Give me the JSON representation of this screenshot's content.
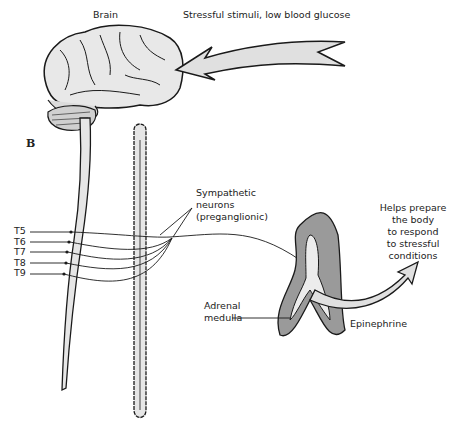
{
  "diagram": {
    "panel_letter": "B",
    "labels": {
      "brain": "Brain",
      "stimulus": "Stressful stimuli, low blood glucose",
      "sympathetic": [
        "Sympathetic",
        "neurons",
        "(preganglionic)"
      ],
      "adrenal": [
        "Adrenal",
        "medulla"
      ],
      "epinephrine": "Epinephrine",
      "effect": [
        "Helps prepare",
        "the body",
        "to respond",
        "to stressful",
        "conditions"
      ]
    },
    "spinal_segments": [
      "T5",
      "T6",
      "T7",
      "T8",
      "T9"
    ],
    "colors": {
      "fill_light": "#e6e6e6",
      "fill_dark": "#9a9a9a",
      "stroke": "#1a1a1a"
    }
  }
}
